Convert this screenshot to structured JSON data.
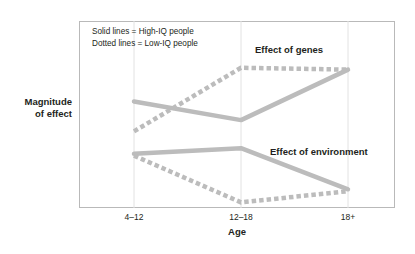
{
  "chart_data": {
    "type": "line",
    "title": "",
    "xlabel": "Age",
    "ylabel": "Magnitude\nof effect",
    "ylabel_lines": [
      "Magnitude",
      "of effect"
    ],
    "categories": [
      "4–12",
      "12–18",
      "18+"
    ],
    "xlim": [
      0,
      2
    ],
    "ylim": [
      0,
      1
    ],
    "y_axis_ticks_shown": false,
    "grid": "vertical gridlines at each category",
    "legend_position": "inside top-left of plot area",
    "legend_entries": [
      "Solid lines = High-IQ people",
      "Dotted lines = Low-IQ people"
    ],
    "annotations": [
      {
        "text": "Effect of genes",
        "near": "genes series, upper right"
      },
      {
        "text": "Effect of environment",
        "near": "environment series, middle right"
      }
    ],
    "line_color": "#bcbcbc",
    "grid_color": "#e2e2e2",
    "frame_color": "#b9b9b9",
    "series": [
      {
        "name": "Effect of genes — High-IQ people",
        "group": "genes",
        "style": "solid",
        "values": [
          0.57,
          0.47,
          0.74
        ]
      },
      {
        "name": "Effect of genes — Low-IQ people",
        "group": "genes",
        "style": "dotted",
        "values": [
          0.41,
          0.75,
          0.74
        ]
      },
      {
        "name": "Effect of environment — High-IQ people",
        "group": "environment",
        "style": "solid",
        "values": [
          0.29,
          0.32,
          0.1
        ]
      },
      {
        "name": "Effect of environment — Low-IQ people",
        "group": "environment",
        "style": "dotted",
        "values": [
          0.28,
          0.03,
          0.09
        ]
      }
    ]
  },
  "axis": {
    "y_title_line1": "Magnitude",
    "y_title_line2": "of effect",
    "x_title": "Age",
    "x_ticks": [
      "4–12",
      "12–18",
      "18+"
    ]
  },
  "legend": {
    "line1": "Solid lines = High-IQ people",
    "line2": "Dotted lines = Low-IQ people"
  },
  "annotations": {
    "genes": "Effect of genes",
    "environment": "Effect of environment"
  }
}
